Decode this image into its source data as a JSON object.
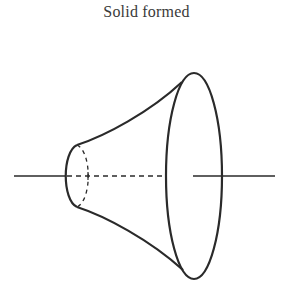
{
  "title": "Solid formed",
  "figure": {
    "stroke_color": "#2a2a2a",
    "axis_y": 176,
    "small_ellipse": {
      "cx": 77,
      "cy": 176,
      "rx": 12,
      "ry": 31
    },
    "large_ellipse": {
      "cx": 194,
      "cy": 176,
      "rx": 28,
      "ry": 103
    }
  }
}
